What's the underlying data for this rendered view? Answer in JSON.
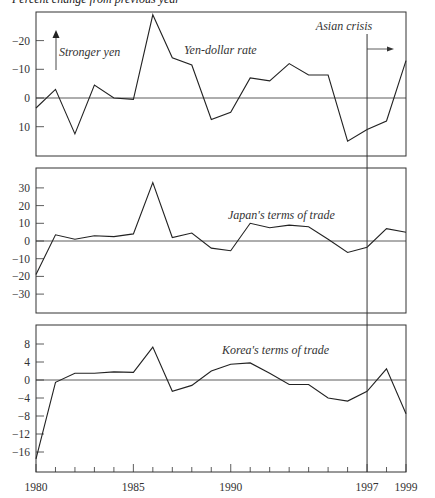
{
  "figure": {
    "title": "Percent change from previous year"
  },
  "annotations": {
    "stronger_yen": "Stronger yen",
    "asian_crisis": "Asian crisis",
    "crisis_year": 1997
  },
  "x_axis": {
    "tick_labels": [
      "1980",
      "1985",
      "1990",
      "1997",
      "1999"
    ],
    "years": [
      1980,
      1981,
      1982,
      1983,
      1984,
      1985,
      1986,
      1987,
      1988,
      1989,
      1990,
      1991,
      1992,
      1993,
      1994,
      1995,
      1996,
      1997,
      1998,
      1999
    ]
  },
  "chart_data": [
    {
      "type": "line",
      "title": "Yen-dollar rate",
      "xlabel": "",
      "ylabel": "Percent change from previous year",
      "y_inverted": true,
      "ylim": [
        -30,
        20
      ],
      "yticks": [
        -20,
        -10,
        0,
        10
      ],
      "ytick_labels": [
        "-20",
        "-10",
        "0",
        "10"
      ],
      "x": [
        1980,
        1981,
        1982,
        1983,
        1984,
        1985,
        1986,
        1987,
        1988,
        1989,
        1990,
        1991,
        1992,
        1993,
        1994,
        1995,
        1996,
        1997,
        1998,
        1999
      ],
      "values": [
        3.5,
        -3,
        12.5,
        -4.5,
        0,
        0.5,
        -29,
        -14,
        -11.5,
        7.5,
        5,
        -7,
        -6,
        -12,
        -8,
        -8,
        15,
        11,
        8,
        -13
      ],
      "label": "Yen-dollar rate"
    },
    {
      "type": "line",
      "title": "Japan's terms of trade",
      "xlabel": "",
      "ylabel": "",
      "ylim": [
        -41,
        41
      ],
      "yticks": [
        30,
        20,
        10,
        0,
        -10,
        -20,
        -30
      ],
      "ytick_labels": [
        "30",
        "20",
        "10",
        "0",
        "-10",
        "-20",
        "-30"
      ],
      "x": [
        1980,
        1981,
        1982,
        1983,
        1984,
        1985,
        1986,
        1987,
        1988,
        1989,
        1990,
        1991,
        1992,
        1993,
        1994,
        1995,
        1996,
        1997,
        1998,
        1999
      ],
      "values": [
        -19,
        3.5,
        1,
        3,
        2.5,
        4,
        33,
        2,
        4.5,
        -4,
        -5.5,
        10,
        7.5,
        9,
        8,
        1,
        -6.5,
        -3.5,
        7,
        5
      ],
      "label": "Japan's terms of trade"
    },
    {
      "type": "line",
      "title": "Korea's terms of trade",
      "xlabel": "",
      "ylabel": "",
      "ylim": [
        -20,
        12
      ],
      "yticks": [
        8,
        4,
        0,
        -4,
        -8,
        -12,
        -16
      ],
      "ytick_labels": [
        "8",
        "4",
        "0",
        "-4",
        "-8",
        "-12",
        "-16"
      ],
      "x": [
        1980,
        1981,
        1982,
        1983,
        1984,
        1985,
        1986,
        1987,
        1988,
        1989,
        1990,
        1991,
        1992,
        1993,
        1994,
        1995,
        1996,
        1997,
        1998,
        1999
      ],
      "values": [
        -17.5,
        -0.5,
        1.5,
        1.5,
        1.8,
        1.7,
        7.3,
        -2.5,
        -1.2,
        2,
        3.5,
        3.8,
        1.5,
        -1,
        -1,
        -4,
        -4.7,
        -2.5,
        2.5,
        -7.5
      ],
      "label": "Korea's terms of trade"
    }
  ]
}
